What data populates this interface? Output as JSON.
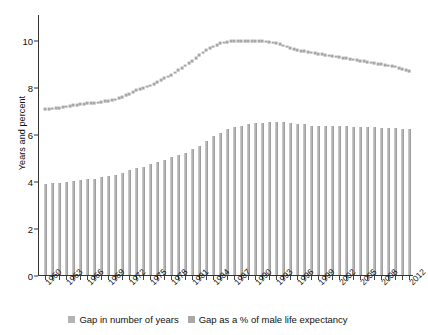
{
  "chart_data": {
    "type": "bar",
    "title": "",
    "subtitle": "",
    "xlabel": "",
    "ylabel": "Years and percent",
    "ylim": [
      0,
      10.8
    ],
    "yticks": [
      0,
      2,
      4,
      6,
      8,
      10
    ],
    "ytick_labels": [
      "0",
      "2",
      "4",
      "6",
      "8",
      "10"
    ],
    "grid": false,
    "legend_position": "bottom-center",
    "x": [
      1960,
      1961,
      1962,
      1963,
      1964,
      1965,
      1966,
      1967,
      1968,
      1969,
      1970,
      1971,
      1972,
      1973,
      1974,
      1975,
      1976,
      1977,
      1978,
      1979,
      1980,
      1981,
      1982,
      1983,
      1984,
      1985,
      1986,
      1987,
      1988,
      1989,
      1990,
      1991,
      1992,
      1993,
      1994,
      1995,
      1996,
      1997,
      1998,
      1999,
      2000,
      2001,
      2002,
      2003,
      2004,
      2005,
      2006,
      2007,
      2008,
      2009,
      2010,
      2011,
      2012
    ],
    "xtick_labels": [
      "1960",
      "1963",
      "1966",
      "1969",
      "1972",
      "1975",
      "1978",
      "1981",
      "1984",
      "1987",
      "1990",
      "1993",
      "1996",
      "1999",
      "2002",
      "2005",
      "2008",
      "2012"
    ],
    "xtick_label_years": [
      1960,
      1963,
      1966,
      1969,
      1972,
      1975,
      1978,
      1981,
      1984,
      1987,
      1990,
      1993,
      1996,
      1999,
      2002,
      2005,
      2008,
      2012
    ],
    "series": [
      {
        "name": "Gap in number of years",
        "render": "bar",
        "color": "#b4b4b4",
        "values": [
          3.85,
          3.9,
          3.9,
          3.95,
          4.0,
          4.05,
          4.1,
          4.1,
          4.15,
          4.2,
          4.25,
          4.35,
          4.45,
          4.55,
          4.6,
          4.7,
          4.8,
          4.9,
          5.0,
          5.1,
          5.2,
          5.35,
          5.5,
          5.7,
          5.9,
          6.05,
          6.2,
          6.3,
          6.35,
          6.4,
          6.45,
          6.45,
          6.5,
          6.5,
          6.5,
          6.45,
          6.4,
          6.4,
          6.35,
          6.35,
          6.35,
          6.35,
          6.35,
          6.35,
          6.3,
          6.3,
          6.3,
          6.3,
          6.25,
          6.25,
          6.25,
          6.2,
          6.2
        ]
      },
      {
        "name": "Gap as a % of male life expectancy",
        "render": "dotted-line",
        "color": "#a8a8a8",
        "values": [
          7.1,
          7.12,
          7.15,
          7.2,
          7.25,
          7.3,
          7.35,
          7.35,
          7.4,
          7.45,
          7.5,
          7.6,
          7.75,
          7.9,
          8.0,
          8.1,
          8.25,
          8.4,
          8.55,
          8.75,
          8.95,
          9.15,
          9.4,
          9.6,
          9.75,
          9.9,
          9.95,
          10.0,
          10.0,
          10.0,
          10.0,
          9.98,
          9.95,
          9.9,
          9.8,
          9.7,
          9.6,
          9.55,
          9.5,
          9.45,
          9.4,
          9.35,
          9.3,
          9.25,
          9.2,
          9.15,
          9.1,
          9.05,
          9.0,
          8.95,
          8.9,
          8.8,
          8.7
        ]
      }
    ]
  },
  "legend": {
    "items": [
      {
        "label": "Gap in number of years",
        "color": "#b4b4b4"
      },
      {
        "label": "Gap as a % of male life expectancy",
        "color": "#a8a8a8"
      }
    ]
  }
}
